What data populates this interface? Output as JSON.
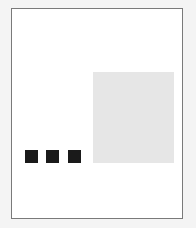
{
  "frame": {
    "background": "#ffffff",
    "border_color": "#7a7a7a"
  },
  "image_placeholder": {
    "color": "#e6e6e6"
  },
  "pagination_dots": {
    "count": 3,
    "color": "#1a1a1a"
  }
}
